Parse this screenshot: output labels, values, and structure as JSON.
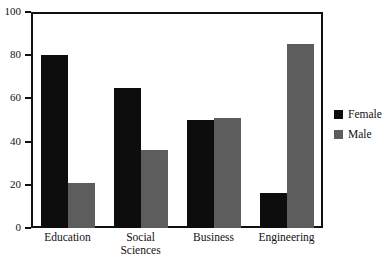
{
  "chart_data": {
    "type": "bar",
    "title": "",
    "subtitle": "",
    "xlabel": "",
    "ylabel": "",
    "categories": [
      "Education",
      "Social\nSciences",
      "Business",
      "Engineering"
    ],
    "series": [
      {
        "name": "Female",
        "color": "#0d0d0d",
        "values": [
          80,
          65,
          50,
          16
        ]
      },
      {
        "name": "Male",
        "color": "#5d5d5d",
        "values": [
          21,
          36,
          51,
          85
        ]
      }
    ],
    "ylim": [
      0,
      100
    ],
    "yticks": [
      0,
      20,
      40,
      60,
      80,
      100
    ],
    "ytick_labels": [
      "0",
      "20",
      "40",
      "60",
      "80",
      "100"
    ],
    "grid": false,
    "legend_position": "right"
  },
  "legend": {
    "items": [
      {
        "label": "Female",
        "swatch": "legend-swatch-female"
      },
      {
        "label": "Male",
        "swatch": "legend-swatch-male"
      }
    ]
  }
}
